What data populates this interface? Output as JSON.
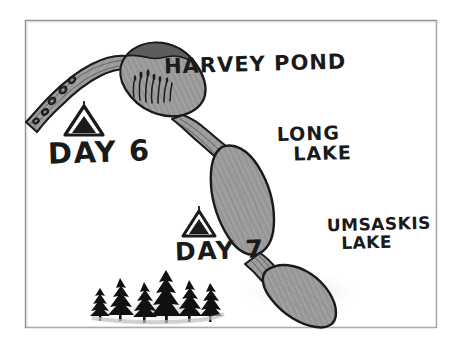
{
  "illustration": {
    "title": "Hand-drawn canoe trip map",
    "medium": "pencil and ink sketch",
    "frame": {
      "border_color": "#8a8a8a",
      "paper_color": "#ffffff"
    }
  },
  "palette": {
    "water_fill": "#9a9a9a",
    "water_outline": "#1a1a1a",
    "ink": "#1a1a1a",
    "tree_fill": "#111111",
    "paper": "#ffffff",
    "shadow": "#c9c9c9"
  },
  "labels": {
    "harvey_pond": "HARVEY POND",
    "long_lake_line1": "LONG",
    "long_lake_line2": "LAKE",
    "umsaskis_lake_line1": "UMSASKIS",
    "umsaskis_lake_line2": "LAKE",
    "day6": "DAY 6",
    "day7": "DAY 7"
  },
  "features": {
    "water_bodies": [
      {
        "name": "inlet-river",
        "label": "",
        "shape": "winding narrow river",
        "position": "upper-left"
      },
      {
        "name": "harvey-pond",
        "label": "HARVEY POND",
        "shape": "elongated oval with reeds",
        "position": "upper-center"
      },
      {
        "name": "long-lake",
        "label": "LONG LAKE",
        "shape": "large elongated oval",
        "position": "center"
      },
      {
        "name": "umsaskis-lake",
        "label": "UMSASKIS LAKE",
        "shape": "rounded bulb",
        "position": "lower-right"
      }
    ],
    "campsites": [
      {
        "name": "campsite-day6",
        "label": "DAY 6",
        "icon": "tent-icon"
      },
      {
        "name": "campsite-day7",
        "label": "DAY 7",
        "icon": "tent-icon"
      }
    ],
    "vegetation": [
      {
        "name": "reeds",
        "icon": "reeds-icon",
        "location": "harvey-pond"
      },
      {
        "name": "pine-forest",
        "icon": "pine-tree-icon",
        "count": 6,
        "location": "lower-left"
      }
    ],
    "rocks": {
      "name": "rocks",
      "icon": "rock-icon",
      "count": 5,
      "location": "inlet-river"
    }
  }
}
